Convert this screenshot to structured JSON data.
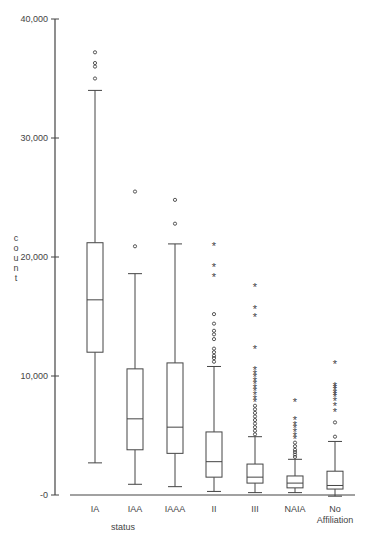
{
  "chart_data": {
    "type": "box",
    "title": "",
    "xlabel": "status",
    "ylabel": "count",
    "ylim": [
      0,
      40000
    ],
    "yticks": [
      0,
      10000,
      20000,
      30000,
      40000
    ],
    "ytick_labels": [
      "-0",
      "10,000",
      "20,000",
      "30,000",
      "40,000"
    ],
    "grid": false,
    "legend": null,
    "categories": [
      "IA",
      "IAA",
      "IAAA",
      "II",
      "III",
      "NAIA",
      "No Affiliation"
    ],
    "category_labels": [
      [
        "IA"
      ],
      [
        "IAA"
      ],
      [
        "IAAA"
      ],
      [
        "II"
      ],
      [
        "III"
      ],
      [
        "NAIA"
      ],
      [
        "No",
        "Affiliation"
      ]
    ],
    "boxes": [
      {
        "name": "IA",
        "whisker_low": 2700,
        "q1": 12000,
        "median": 16400,
        "q3": 21200,
        "whisker_high": 34000,
        "outliers": [
          35000,
          36000,
          36300,
          37200
        ],
        "extremes": []
      },
      {
        "name": "IAA",
        "whisker_low": 900,
        "q1": 3800,
        "median": 6400,
        "q3": 10600,
        "whisker_high": 18600,
        "outliers": [
          20900,
          25500
        ],
        "extremes": []
      },
      {
        "name": "IAAA",
        "whisker_low": 700,
        "q1": 3500,
        "median": 5700,
        "q3": 11100,
        "whisker_high": 21100,
        "outliers": [
          22800,
          24800
        ],
        "extremes": []
      },
      {
        "name": "II",
        "whisker_low": 300,
        "q1": 1500,
        "median": 2800,
        "q3": 5300,
        "whisker_high": 10800,
        "outliers": [
          11200,
          11500,
          11700,
          12000,
          12300,
          13100,
          13500,
          13800,
          14400,
          15200
        ],
        "extremes": [
          18300,
          19200,
          20900
        ]
      },
      {
        "name": "III",
        "whisker_low": 200,
        "q1": 1000,
        "median": 1500,
        "q3": 2600,
        "whisker_high": 4900,
        "outliers": [
          5100,
          5400,
          5700,
          6000,
          6300,
          6600,
          6900,
          7200,
          7500
        ],
        "extremes": [
          7800,
          8100,
          8400,
          8700,
          9000,
          9300,
          9600,
          9900,
          10200,
          10500,
          12300,
          15000,
          15600,
          17500
        ]
      },
      {
        "name": "NAIA",
        "whisker_low": 200,
        "q1": 600,
        "median": 1000,
        "q3": 1600,
        "whisker_high": 3000,
        "outliers": [
          3200,
          3400,
          3600,
          3800,
          4100,
          4400
        ],
        "extremes": [
          4700,
          5000,
          5300,
          5600,
          5900,
          6300,
          7800
        ]
      },
      {
        "name": "No Affiliation",
        "whisker_low": -100,
        "q1": 500,
        "median": 800,
        "q3": 2000,
        "whisker_high": 4500,
        "outliers": [
          4900,
          6100
        ],
        "extremes": [
          7000,
          7500,
          7900,
          8200,
          8400,
          8600,
          8800,
          9000,
          9200,
          11000
        ]
      }
    ],
    "marker_legend": {
      "o": "outlier",
      "*": "extreme value"
    }
  },
  "colors": {
    "axis": "#444444",
    "box_stroke": "#444444",
    "box_fill": "#ffffff",
    "background": "#ffffff"
  }
}
